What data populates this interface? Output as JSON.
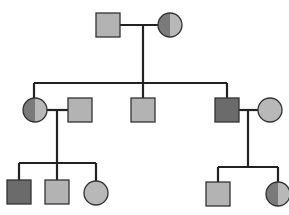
{
  "diagram": {
    "type": "pedigree",
    "colors": {
      "unaffected": "#b3b3b3",
      "affected": "#6b6b6b",
      "carrier_dark": "#7a7a7a",
      "carrier_light": "#b8b8b8",
      "stroke": "#222222"
    },
    "generations": [
      {
        "label": "I",
        "individuals": [
          {
            "id": "I-1",
            "sex": "male",
            "status": "unaffected"
          },
          {
            "id": "I-2",
            "sex": "female",
            "status": "carrier"
          }
        ]
      },
      {
        "label": "II",
        "individuals": [
          {
            "id": "II-1",
            "sex": "female",
            "status": "carrier"
          },
          {
            "id": "II-2",
            "sex": "male",
            "status": "unaffected",
            "note": "spouse"
          },
          {
            "id": "II-3",
            "sex": "male",
            "status": "unaffected"
          },
          {
            "id": "II-4",
            "sex": "male",
            "status": "affected"
          },
          {
            "id": "II-5",
            "sex": "female",
            "status": "unaffected",
            "note": "spouse"
          }
        ]
      },
      {
        "label": "III",
        "individuals": [
          {
            "id": "III-1",
            "sex": "male",
            "status": "affected"
          },
          {
            "id": "III-2",
            "sex": "male",
            "status": "unaffected"
          },
          {
            "id": "III-3",
            "sex": "female",
            "status": "unaffected"
          },
          {
            "id": "III-4",
            "sex": "male",
            "status": "unaffected"
          },
          {
            "id": "III-5",
            "sex": "female",
            "status": "carrier"
          }
        ]
      }
    ]
  }
}
